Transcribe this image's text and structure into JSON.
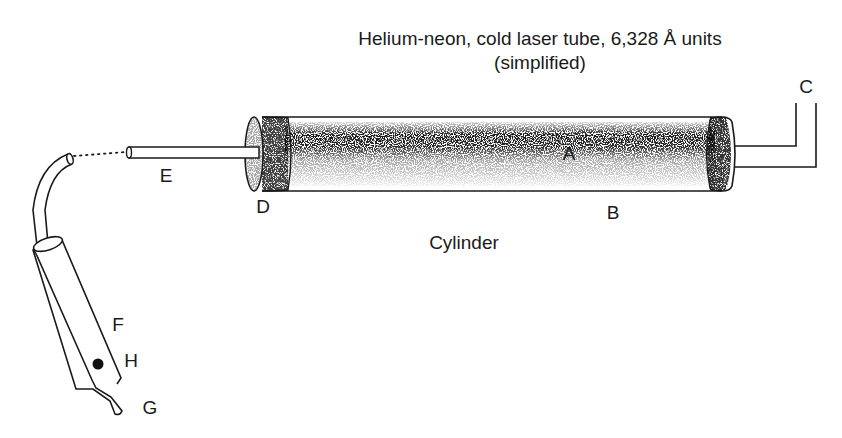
{
  "title": {
    "line1": "Helium-neon, cold laser tube, 6,328 Å units",
    "line2": "(simplified)"
  },
  "labels": {
    "A": "A",
    "B": "B",
    "C": "C",
    "D": "D",
    "E": "E",
    "F": "F",
    "G": "G",
    "H": "H",
    "cylinder": "Cylinder"
  },
  "colors": {
    "ink": "#1a1a1a",
    "background": "#ffffff"
  }
}
